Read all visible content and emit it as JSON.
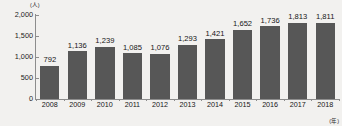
{
  "chart_data": {
    "type": "bar",
    "title": "",
    "subtitle": "",
    "xlabel": "(年)",
    "ylabel": "(人)",
    "categories": [
      "2008",
      "2009",
      "2010",
      "2011",
      "2012",
      "2013",
      "2014",
      "2015",
      "2016",
      "2017",
      "2018"
    ],
    "values": [
      792,
      1136,
      1239,
      1085,
      1076,
      1293,
      1421,
      1652,
      1736,
      1813,
      1811
    ],
    "value_labels": [
      "792",
      "1,136",
      "1,239",
      "1,085",
      "1,076",
      "1,293",
      "1,421",
      "1,652",
      "1,736",
      "1,813",
      "1,811"
    ],
    "ylim": [
      0,
      2000
    ],
    "y_ticks": [
      0,
      500,
      1000,
      1500,
      2000
    ],
    "y_tick_labels": [
      "0",
      "500",
      "1,000",
      "1,500",
      "2,000"
    ],
    "grid": false,
    "legend": null,
    "bar_color": "#575757",
    "background_color": "#f2f1ef",
    "axis_color": "#8d8d8d",
    "text_color": "#161616"
  },
  "axis": {
    "y_unit": "(人)",
    "x_unit": "(年)"
  }
}
